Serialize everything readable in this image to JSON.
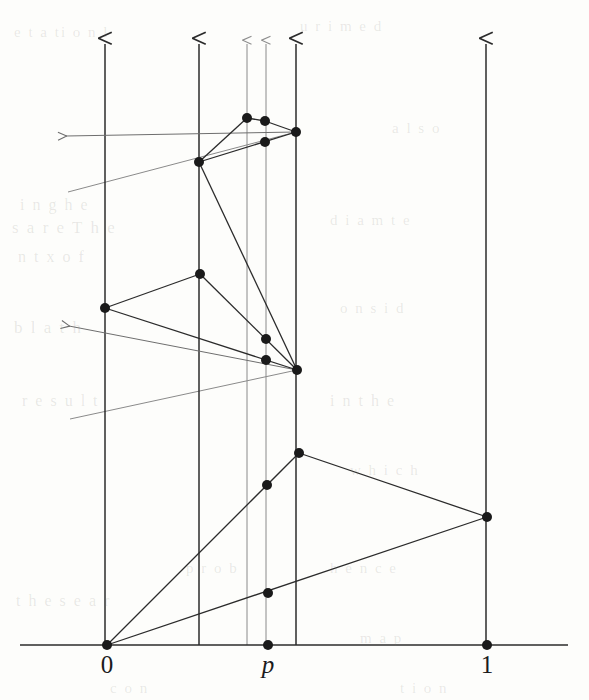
{
  "figure": {
    "kind": "mathematical-diagram",
    "background_color": "#fdfdfb",
    "ink_color": "#2b2b2b",
    "faint_ink_color": "#8a8a8a",
    "node_color": "#1a1a1a",
    "node_radius": 5
  },
  "axis": {
    "name": "number-line",
    "y": 645,
    "x_start": 20,
    "x_end": 568,
    "ticks": [
      {
        "id": "tick-0",
        "label": "0",
        "x": 107,
        "italic": false
      },
      {
        "id": "tick-p",
        "label": "p",
        "x": 268,
        "italic": true
      },
      {
        "id": "tick-1",
        "label": "1",
        "x": 487,
        "italic": false
      }
    ],
    "label_y": 652
  },
  "vertical_rays": [
    {
      "id": "ray-0",
      "x": 105,
      "y_bottom": 645,
      "y_top": 44,
      "weight": "strong"
    },
    {
      "id": "ray-a",
      "x": 199,
      "y_bottom": 645,
      "y_top": 44,
      "weight": "strong"
    },
    {
      "id": "ray-b",
      "x": 247,
      "y_bottom": 645,
      "y_top": 44,
      "weight": "faint"
    },
    {
      "id": "ray-p",
      "x": 266,
      "y_bottom": 645,
      "y_top": 44,
      "weight": "faint"
    },
    {
      "id": "ray-c",
      "x": 296,
      "y_bottom": 645,
      "y_top": 44,
      "weight": "strong"
    },
    {
      "id": "ray-1",
      "x": 486,
      "y_bottom": 645,
      "y_top": 44,
      "weight": "strong"
    }
  ],
  "left_rays": [
    {
      "id": "left-ray-upper",
      "tip_x": 66,
      "tip_y": 136,
      "tail_x": 296,
      "tail_y": 132
    },
    {
      "id": "left-ray-lower",
      "tip_x": 69,
      "tip_y": 326,
      "tail_x": 297,
      "tail_y": 370
    }
  ],
  "stray_lines": [
    {
      "id": "stray-upper",
      "x1": 68,
      "y1": 192,
      "x2": 296,
      "y2": 132
    },
    {
      "id": "stray-lower",
      "x1": 70,
      "y1": 419,
      "x2": 297,
      "y2": 370
    }
  ],
  "nodes": [
    {
      "id": "node-origin",
      "x": 107,
      "y": 645
    },
    {
      "id": "node-p-base",
      "x": 268,
      "y": 645
    },
    {
      "id": "node-1-base",
      "x": 487,
      "y": 645
    },
    {
      "id": "node-p-low",
      "x": 268,
      "y": 593
    },
    {
      "id": "node-1-mid",
      "x": 487,
      "y": 517
    },
    {
      "id": "node-p-mid",
      "x": 267,
      "y": 485
    },
    {
      "id": "node-c-low",
      "x": 299,
      "y": 453
    },
    {
      "id": "node-c-hub",
      "x": 297,
      "y": 370
    },
    {
      "id": "node-p-upper",
      "x": 266,
      "y": 360
    },
    {
      "id": "node-b-upper",
      "x": 266,
      "y": 339
    },
    {
      "id": "node-a-mid",
      "x": 200,
      "y": 274
    },
    {
      "id": "node-0-mid",
      "x": 105,
      "y": 308
    },
    {
      "id": "node-a-hub",
      "x": 199,
      "y": 162
    },
    {
      "id": "node-c-top",
      "x": 296,
      "y": 132
    },
    {
      "id": "node-p-top",
      "x": 265,
      "y": 142
    },
    {
      "id": "node-p-high",
      "x": 265,
      "y": 121
    },
    {
      "id": "node-b-top",
      "x": 247,
      "y": 118
    }
  ],
  "edges": [
    {
      "id": "edge-origin-to-c-low",
      "from": "node-origin",
      "to": "node-c-low",
      "weight": "strong"
    },
    {
      "id": "edge-origin-to-1-mid",
      "from": "node-origin",
      "to": "node-1-mid",
      "weight": "strong"
    },
    {
      "id": "edge-c-low-to-1-mid",
      "from": "node-c-low",
      "to": "node-1-mid",
      "weight": "strong"
    },
    {
      "id": "edge-c-hub-to-0-mid",
      "from": "node-c-hub",
      "to": "node-0-mid",
      "weight": "strong"
    },
    {
      "id": "edge-0-mid-to-a-mid",
      "from": "node-0-mid",
      "to": "node-a-mid",
      "weight": "strong"
    },
    {
      "id": "edge-a-mid-to-c-hub",
      "from": "node-a-mid",
      "to": "node-c-hub",
      "weight": "strong"
    },
    {
      "id": "edge-a-hub-to-c-hub",
      "from": "node-a-hub",
      "to": "node-c-hub",
      "weight": "strong"
    },
    {
      "id": "edge-a-hub-to-b-top",
      "from": "node-a-hub",
      "to": "node-b-top",
      "weight": "strong"
    },
    {
      "id": "edge-b-top-to-p-high",
      "from": "node-b-top",
      "to": "node-p-high",
      "weight": "strong"
    },
    {
      "id": "edge-p-high-to-c-top",
      "from": "node-p-high",
      "to": "node-c-top",
      "weight": "strong"
    },
    {
      "id": "edge-a-hub-to-c-top",
      "from": "node-a-hub",
      "to": "node-c-top",
      "weight": "strong"
    }
  ],
  "ghost_marks": [
    {
      "id": "ghost-1",
      "text": "e t  a   ti  o    n   l",
      "x": 14,
      "y": 24,
      "size": 15
    },
    {
      "id": "ghost-2",
      "text": "u   r  i   m   e  d",
      "x": 300,
      "y": 18,
      "size": 15
    },
    {
      "id": "ghost-3",
      "text": "i    n  g    h  e",
      "x": 20,
      "y": 196,
      "size": 16
    },
    {
      "id": "ghost-4",
      "text": "s  a  r   e    T  h  e",
      "x": 12,
      "y": 218,
      "size": 17
    },
    {
      "id": "ghost-5",
      "text": "n   t     x      o   f",
      "x": 18,
      "y": 248,
      "size": 16
    },
    {
      "id": "ghost-6",
      "text": "b  l      a  t    h",
      "x": 14,
      "y": 318,
      "size": 17
    },
    {
      "id": "ghost-7",
      "text": "d   i   a    m     t  e",
      "x": 330,
      "y": 212,
      "size": 15
    },
    {
      "id": "ghost-8",
      "text": "o   n   s    i     d",
      "x": 340,
      "y": 300,
      "size": 15
    },
    {
      "id": "ghost-9",
      "text": "r  e   s   u   l  t",
      "x": 22,
      "y": 392,
      "size": 16
    },
    {
      "id": "ghost-10",
      "text": "i   n     t   h   e",
      "x": 330,
      "y": 392,
      "size": 16
    },
    {
      "id": "ghost-11",
      "text": "p   r   o    b",
      "x": 186,
      "y": 560,
      "size": 15
    },
    {
      "id": "ghost-12",
      "text": "h   e    n    c   e",
      "x": 330,
      "y": 560,
      "size": 15
    },
    {
      "id": "ghost-13",
      "text": "t   h  e    s  e     a  r",
      "x": 16,
      "y": 592,
      "size": 16
    },
    {
      "id": "ghost-14",
      "text": "m   a   p",
      "x": 360,
      "y": 630,
      "size": 15
    },
    {
      "id": "ghost-15",
      "text": "c  o   n",
      "x": 110,
      "y": 680,
      "size": 15
    },
    {
      "id": "ghost-16",
      "text": "t   i   o   n",
      "x": 400,
      "y": 680,
      "size": 15
    },
    {
      "id": "ghost-17",
      "text": "a    l   s   o",
      "x": 392,
      "y": 120,
      "size": 15
    },
    {
      "id": "ghost-18",
      "text": "w   h   i   c   h",
      "x": 350,
      "y": 462,
      "size": 15
    }
  ]
}
